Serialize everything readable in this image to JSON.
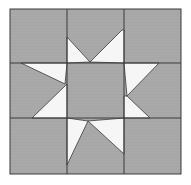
{
  "diagram": {
    "type": "quilt-block",
    "pattern": "eight-pointed star (sawtooth star) on 3x3 grid",
    "grid": {
      "rows": 3,
      "cols": 3
    },
    "colors": {
      "background": "#a9a9a9",
      "star": "#f6f6f6",
      "line": "#3a3a3a",
      "page": "#ffffff"
    },
    "bounds": {
      "x0": 10,
      "y0": 9,
      "x1": 181,
      "y1": 174
    },
    "col_lines": [
      67,
      124
    ],
    "row_lines": [
      63,
      118
    ],
    "star_pieces": [
      {
        "name": "top-left-point",
        "points": "67,37 90,62 67,63"
      },
      {
        "name": "top-right-point",
        "points": "122,30 124,30 124,63 90,62"
      },
      {
        "name": "left-upper-point",
        "points": "21,63 67,63 65,84"
      },
      {
        "name": "left-lower-point",
        "points": "67,84 67,118 32,118"
      },
      {
        "name": "right-upper-point",
        "points": "124,63 159,63 127,96"
      },
      {
        "name": "right-lower-point",
        "points": "127,96 150,118 124,118 124,96"
      },
      {
        "name": "bottom-left-point",
        "points": "67,118 88,121 67,165"
      },
      {
        "name": "bottom-right-point",
        "points": "88,121 124,118 124,154"
      }
    ]
  }
}
